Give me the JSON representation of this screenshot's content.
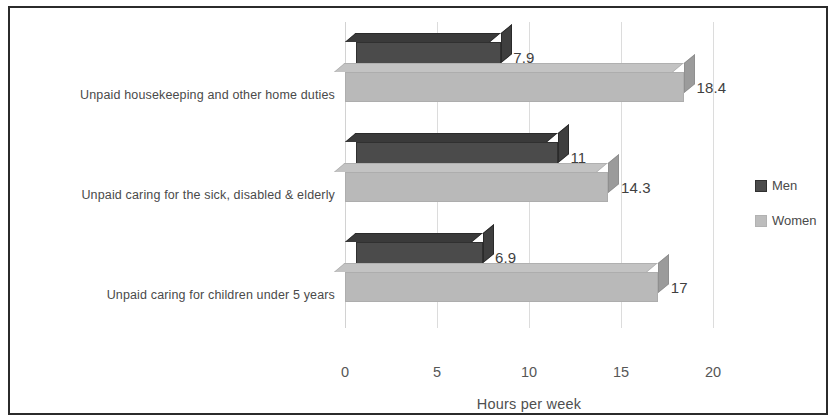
{
  "chart_data": {
    "type": "bar",
    "orientation": "horizontal",
    "style": "3d-clustered-bar",
    "title": "",
    "xlabel": "Hours per week",
    "ylabel": "",
    "xlim": [
      0,
      20
    ],
    "xticks": [
      "0",
      "5",
      "10",
      "15",
      "20"
    ],
    "grid": true,
    "legend_position": "right",
    "categories": [
      "Unpaid housekeeping and other home duties",
      "Unpaid caring for the sick, disabled & elderly",
      "Unpaid caring for children under 5 years"
    ],
    "series": [
      {
        "name": "Men",
        "color": "#4b4b4b",
        "values": [
          7.9,
          11,
          6.9
        ],
        "labels": [
          "7.9",
          "11",
          "6.9"
        ]
      },
      {
        "name": "Women",
        "color": "#b9b9b9",
        "values": [
          18.4,
          14.3,
          17
        ],
        "labels": [
          "18.4",
          "14.3",
          "17"
        ]
      }
    ]
  },
  "legend": {
    "items": [
      {
        "label": "Men"
      },
      {
        "label": "Women"
      }
    ]
  },
  "axis": {
    "x_title": "Hours per week",
    "ticks": [
      {
        "value": "0"
      },
      {
        "value": "5"
      },
      {
        "value": "10"
      },
      {
        "value": "15"
      },
      {
        "value": "20"
      }
    ]
  }
}
